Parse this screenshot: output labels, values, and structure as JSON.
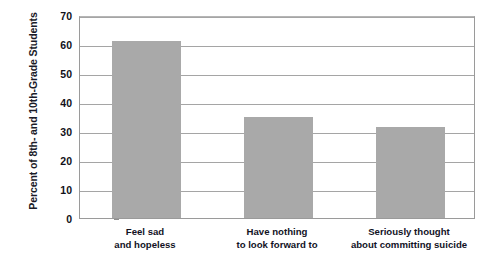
{
  "chart_data": {
    "type": "bar",
    "title": "",
    "subtitle": "",
    "xlabel": "",
    "ylabel": "Percent of 8th- and 10th-Grade Students",
    "categories": [
      "Feel sad\nand hopeless",
      "Have nothing\nto look forward to",
      "Seriously thought\nabout committing suicide"
    ],
    "category_lines": [
      [
        "Feel sad",
        "and hopeless"
      ],
      [
        "Have nothing",
        "to look forward to"
      ],
      [
        "Seriously thought",
        "about committing suicide"
      ]
    ],
    "values": [
      61,
      35,
      31.5
    ],
    "ylim": [
      0,
      70
    ],
    "yticks": [
      0,
      10,
      20,
      30,
      40,
      50,
      60,
      70
    ],
    "ytick_labels": [
      "0",
      "10",
      "20",
      "30",
      "40",
      "50",
      "60",
      "70"
    ],
    "grid": true,
    "legend": false,
    "legend_position": "none",
    "bar_color": "#a9a9a9",
    "plot_border_color": "#9a9a9a",
    "gridline_color": "#a5a5a5",
    "background_color": "#ffffff",
    "text_color": "#12121f"
  }
}
